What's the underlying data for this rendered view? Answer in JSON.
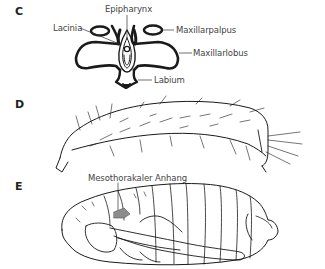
{
  "figure": {
    "panels": [
      {
        "id": "C",
        "letter": "C",
        "subject": "mouthparts (front view)",
        "labels": {
          "epipharynx": "Epipharynx",
          "lacinia": "Lacinia",
          "maxillarpalpus": "Maxillarpalpus",
          "maxillarlobus": "Maxillarlobus",
          "labium": "Labium"
        }
      },
      {
        "id": "D",
        "letter": "D",
        "subject": "larva (lateral view, setose)",
        "labels": {}
      },
      {
        "id": "E",
        "letter": "E",
        "subject": "pupa (lateral view)",
        "labels": {
          "mesothorakaler_anhang": "Mesothorakaler Anhang"
        },
        "highlight_color": "#8c8c8c"
      }
    ],
    "colors": {
      "line": "#1a1a1a",
      "label_text": "#444444",
      "background": "#ffffff"
    }
  }
}
